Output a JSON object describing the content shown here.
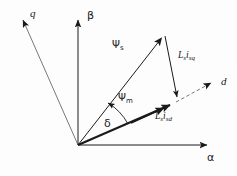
{
  "figure": {
    "type": "phasor-vector-diagram",
    "background_color": "#fdfdfd",
    "stroke_color": "#1a1a1a"
  },
  "axes": [
    {
      "id": "alpha",
      "label": "α",
      "kind": "stationary-axis",
      "direction": "horizontal-right"
    },
    {
      "id": "beta",
      "label": "β",
      "kind": "stationary-axis",
      "direction": "vertical-up"
    },
    {
      "id": "d",
      "label": "d",
      "kind": "rotor-axis",
      "direction": "up-right-dashed"
    },
    {
      "id": "q",
      "label": "q",
      "kind": "rotor-axis",
      "direction": "up-left"
    }
  ],
  "vectors": [
    {
      "id": "psi_s",
      "label_base": "Ψ",
      "label_sub": "s",
      "style": "thin-solid",
      "desc": "stator flux linkage"
    },
    {
      "id": "psi_m",
      "label_base": "Ψ",
      "label_sub": "m",
      "style": "thick-solid",
      "desc": "magnet flux linkage"
    }
  ],
  "components": [
    {
      "id": "ls_isq",
      "base": "L",
      "base_sub": "s",
      "second": "i",
      "second_sub": "sq",
      "desc": "q-axis inductance drop"
    },
    {
      "id": "ls_isd",
      "base": "L",
      "base_sub": "s",
      "second": "i",
      "second_sub": "sd",
      "desc": "d-axis inductance drop"
    }
  ],
  "angles": [
    {
      "id": "delta",
      "label": "δ",
      "desc": "load angle between psi_m and psi_s"
    }
  ],
  "labels": {
    "alpha": "α",
    "beta": "β",
    "d": "d",
    "q": "q",
    "delta": "δ",
    "psi_s_base": "Ψ",
    "psi_s_sub": "s",
    "psi_m_base": "Ψ",
    "psi_m_sub": "m",
    "ls_isq_L": "L",
    "ls_isq_L_sub": "s",
    "ls_isq_i": "i",
    "ls_isq_i_sub": "sq",
    "ls_isd_L": "L",
    "ls_isd_L_sub": "s",
    "ls_isd_i": "i",
    "ls_isd_i_sub": "sd"
  },
  "geometry": {
    "origin": {
      "x": 78,
      "y": 145
    },
    "alpha_tip": {
      "x": 215,
      "y": 145
    },
    "beta_tip": {
      "x": 78,
      "y": 12
    },
    "q_tip": {
      "x": 18,
      "y": 14
    },
    "d_tip": {
      "x": 219,
      "y": 79
    },
    "psi_s_tip": {
      "x": 163,
      "y": 34
    },
    "psi_m_tip": {
      "x": 176,
      "y": 102
    }
  }
}
